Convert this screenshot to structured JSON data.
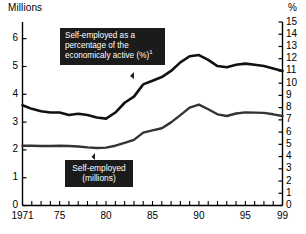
{
  "axes": {
    "left_title": "Millions",
    "right_title": "%",
    "left_ticks": [
      "0",
      "1",
      "2",
      "3",
      "4",
      "5",
      "6"
    ],
    "right_ticks": [
      "0",
      "1",
      "2",
      "3",
      "4",
      "5",
      "6",
      "7",
      "8",
      "9",
      "10",
      "11",
      "12",
      "13",
      "14",
      "15"
    ],
    "x_ticks": [
      "1971",
      "75",
      "80",
      "85",
      "90",
      "95",
      "99"
    ]
  },
  "callouts": {
    "percentage": {
      "line1": "Self-employed as a",
      "line2": "percentage of the",
      "line3": "economicaly active (%)",
      "footnote": "1"
    },
    "millions": {
      "line1": "Self-employed",
      "line2": "(millions)"
    }
  },
  "chart_data": {
    "type": "line",
    "title": "",
    "xlabel": "",
    "ylabel": "Millions",
    "y2label": "%",
    "xlim": [
      1971,
      1999
    ],
    "ylim": [
      0,
      6.6
    ],
    "y2lim": [
      0,
      15
    ],
    "grid": false,
    "legend": "annotated-callouts",
    "x": [
      1971,
      1972,
      1973,
      1974,
      1975,
      1976,
      1977,
      1978,
      1979,
      1980,
      1981,
      1982,
      1983,
      1984,
      1985,
      1986,
      1987,
      1988,
      1989,
      1990,
      1991,
      1992,
      1993,
      1994,
      1995,
      1996,
      1997,
      1998,
      1999
    ],
    "series": [
      {
        "name": "Self-employed as a percentage of the economicaly active (%)",
        "axis": "right",
        "units": "%",
        "values": [
          8.2,
          7.9,
          7.7,
          7.6,
          7.6,
          7.4,
          7.5,
          7.4,
          7.2,
          7.1,
          7.6,
          8.4,
          8.9,
          9.9,
          10.2,
          10.5,
          11.0,
          11.7,
          12.2,
          12.3,
          11.9,
          11.4,
          11.3,
          11.5,
          11.6,
          11.5,
          11.4,
          11.2,
          11.0
        ]
      },
      {
        "name": "Self-employed (millions)",
        "axis": "left",
        "units": "millions",
        "values": [
          2.15,
          2.15,
          2.14,
          2.14,
          2.15,
          2.14,
          2.12,
          2.09,
          2.07,
          2.08,
          2.15,
          2.25,
          2.36,
          2.62,
          2.7,
          2.78,
          2.99,
          3.25,
          3.52,
          3.63,
          3.46,
          3.28,
          3.22,
          3.31,
          3.35,
          3.34,
          3.33,
          3.28,
          3.22
        ]
      }
    ]
  }
}
